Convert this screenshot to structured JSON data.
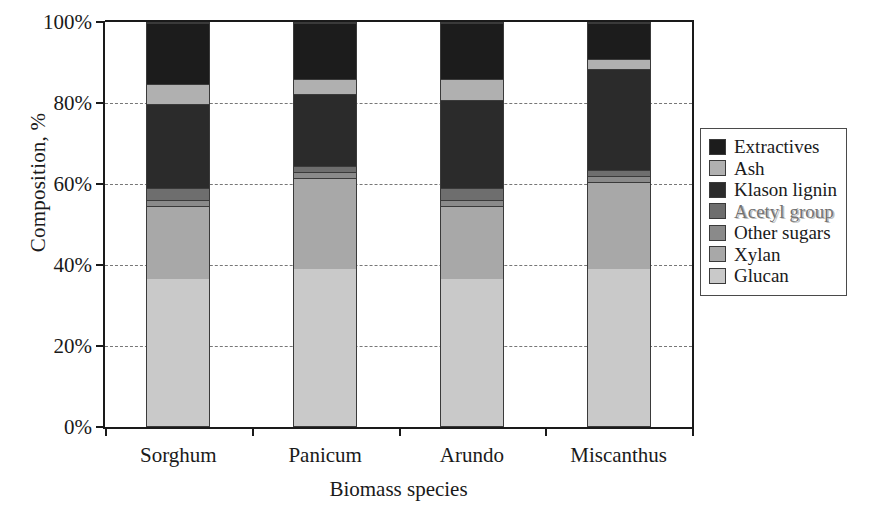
{
  "chart_data": {
    "type": "bar",
    "stacked": true,
    "title": "",
    "xlabel": "Biomass species",
    "ylabel": "Composition, %",
    "categories": [
      "Sorghum",
      "Panicum",
      "Arundo",
      "Miscanthus"
    ],
    "ylim": [
      0,
      100
    ],
    "ytick_labels": [
      "0%",
      "20%",
      "40%",
      "60%",
      "80%",
      "100%"
    ],
    "ytick_values": [
      0,
      20,
      40,
      60,
      80,
      100
    ],
    "grid": "horizontal-dashed",
    "legend_position": "right",
    "series": [
      {
        "name": "Glucan",
        "color": "#c9c9c9",
        "values": [
          36.5,
          39.0,
          36.5,
          39.0
        ]
      },
      {
        "name": "Xylan",
        "color": "#a8a8a8",
        "values": [
          18.0,
          22.5,
          18.0,
          21.5
        ]
      },
      {
        "name": "Other sugars",
        "color": "#8a8a8a",
        "values": [
          1.5,
          1.5,
          1.5,
          1.5
        ]
      },
      {
        "name": "Acetyl group",
        "color": "#6e6e6e",
        "values": [
          3.0,
          1.5,
          3.0,
          1.5
        ]
      },
      {
        "name": "Klason lignin",
        "color": "#2b2b2b",
        "values": [
          21.0,
          18.0,
          22.0,
          25.0
        ]
      },
      {
        "name": "Ash",
        "color": "#b0b0b0",
        "values": [
          5.0,
          3.5,
          5.0,
          2.5
        ]
      },
      {
        "name": "Extractives",
        "color": "#1c1c1c",
        "values": [
          15.0,
          14.0,
          14.0,
          9.0
        ]
      }
    ],
    "legend_order": [
      "Extractives",
      "Ash",
      "Klason lignin",
      "Acetyl group",
      "Other sugars",
      "Xylan",
      "Glucan"
    ]
  },
  "legend": {
    "items": [
      {
        "label": "Extractives",
        "swatch": "#1c1c1c"
      },
      {
        "label": "Ash",
        "swatch": "#b0b0b0"
      },
      {
        "label": "Klason lignin",
        "swatch": "#2b2b2b"
      },
      {
        "label": "Acetyl group",
        "swatch": "#6e6e6e"
      },
      {
        "label": "Other sugars",
        "swatch": "#8a8a8a"
      },
      {
        "label": "Xylan",
        "swatch": "#a8a8a8"
      },
      {
        "label": "Glucan",
        "swatch": "#c9c9c9"
      }
    ]
  }
}
